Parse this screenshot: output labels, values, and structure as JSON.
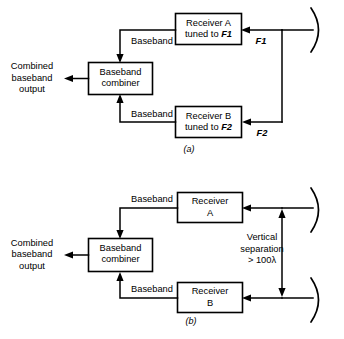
{
  "figure": {
    "panels": [
      {
        "id": "a",
        "caption": "(a)",
        "scheme": "frequency-diversity",
        "blocks": [
          {
            "id": "receiver-a",
            "line1": "Receiver A",
            "line2_prefix": "tuned to ",
            "line2_italic": "F1"
          },
          {
            "id": "receiver-b",
            "line1": "Receiver B",
            "line2_prefix": "tuned to ",
            "line2_italic": "F2"
          },
          {
            "id": "baseband-combiner",
            "line1": "Baseband",
            "line2": "combiner"
          }
        ],
        "wire_labels": [
          {
            "id": "baseband-top",
            "text": "Baseband"
          },
          {
            "id": "baseband-bottom",
            "text": "Baseband"
          }
        ],
        "freq_labels": [
          {
            "id": "f1",
            "text": "F1"
          },
          {
            "id": "f2",
            "text": "F2"
          }
        ],
        "output_label": {
          "line1": "Combined",
          "line2": "baseband",
          "line3": "output"
        },
        "antennas": [
          {
            "id": "antenna-shared",
            "type": "dish-reflector"
          }
        ]
      },
      {
        "id": "b",
        "caption": "(b)",
        "scheme": "space-diversity",
        "blocks": [
          {
            "id": "receiver-a",
            "line1": "Receiver",
            "line2": "A"
          },
          {
            "id": "receiver-b",
            "line1": "Receiver",
            "line2": "B"
          },
          {
            "id": "baseband-combiner",
            "line1": "Baseband",
            "line2": "combiner"
          }
        ],
        "wire_labels": [
          {
            "id": "baseband-top",
            "text": "Baseband"
          },
          {
            "id": "baseband-bottom",
            "text": "Baseband"
          }
        ],
        "output_label": {
          "line1": "Combined",
          "line2": "baseband",
          "line3": "output"
        },
        "separation_label": {
          "line1": "Vertical",
          "line2": "separation",
          "line3": "> 100λ"
        },
        "antennas": [
          {
            "id": "antenna-upper",
            "type": "dish-reflector"
          },
          {
            "id": "antenna-lower",
            "type": "dish-reflector"
          }
        ]
      }
    ],
    "colors": {
      "ink": "#000000",
      "paper": "#ffffff"
    }
  }
}
